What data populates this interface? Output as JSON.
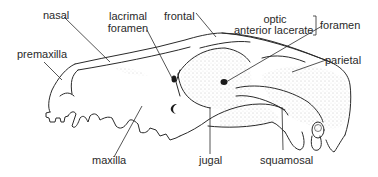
{
  "diagram": {
    "labels": {
      "nasal": "nasal",
      "lacrimal_foramen_line1": "lacrimal",
      "lacrimal_foramen_line2": "foramen",
      "frontal": "frontal",
      "optic": "optic",
      "anterior_lacerate": "anterior lacerate",
      "foramen": "foramen",
      "premaxilla": "premaxilla",
      "parietal": "parietal",
      "maxilla": "maxilla",
      "jugal": "jugal",
      "squamosal": "squamosal"
    },
    "colors": {
      "line": "#2a2a2a",
      "stipple": "#8a8a8a",
      "background": "#ffffff"
    }
  }
}
